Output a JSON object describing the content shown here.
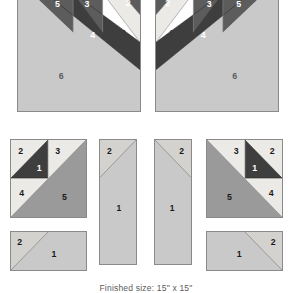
{
  "figure": {
    "caption": "Finished size: 15\" x 15\"",
    "palette": {
      "light": "#c9c9c9",
      "offwhite": "#eceae6",
      "medium": "#9a9a9a",
      "medium_dark": "#5c5c5c",
      "dark": "#3e3e3e",
      "outline": "#8a8a8a",
      "label_light": "#ffffff",
      "label_dark": "#1a1a1a",
      "caption_color": "#5b5b5b",
      "background": "#ffffff"
    }
  },
  "blocks": [
    {
      "id": "large-block-left",
      "name": "Large block A (left)",
      "pieces": [
        {
          "num": "1",
          "shade": "offwhite"
        },
        {
          "num": "2",
          "shade": "medium_dark"
        },
        {
          "num": "3",
          "shade": "medium_dark"
        },
        {
          "num": "4",
          "shade": "dark"
        },
        {
          "num": "5",
          "shade": "medium_dark"
        },
        {
          "num": "6",
          "shade": "light"
        }
      ]
    },
    {
      "id": "large-block-right",
      "name": "Large block B (right, mirrored)",
      "pieces": [
        {
          "num": "1",
          "shade": "offwhite"
        },
        {
          "num": "2",
          "shade": "medium_dark"
        },
        {
          "num": "3",
          "shade": "medium_dark"
        },
        {
          "num": "4",
          "shade": "dark"
        },
        {
          "num": "5",
          "shade": "medium_dark"
        },
        {
          "num": "6",
          "shade": "light"
        }
      ]
    },
    {
      "id": "unit-a",
      "name": "Unit A square (left)",
      "pieces": [
        {
          "num": "1",
          "shade": "dark"
        },
        {
          "num": "2",
          "shade": "offwhite"
        },
        {
          "num": "3",
          "shade": "offwhite"
        },
        {
          "num": "4",
          "shade": "offwhite"
        },
        {
          "num": "5",
          "shade": "medium"
        }
      ]
    },
    {
      "id": "unit-b",
      "name": "Unit B tall rectangle (left)",
      "pieces": [
        {
          "num": "1",
          "shade": "light"
        },
        {
          "num": "2",
          "shade": "light"
        }
      ]
    },
    {
      "id": "unit-c",
      "name": "Unit C tall rectangle (right)",
      "pieces": [
        {
          "num": "1",
          "shade": "light"
        },
        {
          "num": "2",
          "shade": "light"
        }
      ]
    },
    {
      "id": "unit-d",
      "name": "Unit D square (right, mirrored)",
      "pieces": [
        {
          "num": "1",
          "shade": "dark"
        },
        {
          "num": "2",
          "shade": "offwhite"
        },
        {
          "num": "3",
          "shade": "offwhite"
        },
        {
          "num": "4",
          "shade": "offwhite"
        },
        {
          "num": "5",
          "shade": "medium"
        }
      ]
    },
    {
      "id": "unit-e",
      "name": "Unit E wide rectangle (bottom left)",
      "pieces": [
        {
          "num": "1",
          "shade": "light"
        },
        {
          "num": "2",
          "shade": "light"
        }
      ]
    },
    {
      "id": "unit-f",
      "name": "Unit F wide rectangle (bottom right)",
      "pieces": [
        {
          "num": "1",
          "shade": "light"
        },
        {
          "num": "2",
          "shade": "light"
        }
      ]
    }
  ],
  "labels": {
    "large_left": {
      "p1": "1",
      "p2": "2",
      "p3": "3",
      "p4": "4",
      "p5": "5",
      "p6": "6"
    },
    "large_right": {
      "p1": "1",
      "p2": "2",
      "p3": "3",
      "p4": "4",
      "p5": "5",
      "p6": "6"
    },
    "unit_a": {
      "p1": "1",
      "p2": "2",
      "p3": "3",
      "p4": "4",
      "p5": "5"
    },
    "unit_b": {
      "p1": "1",
      "p2": "2"
    },
    "unit_c": {
      "p1": "1",
      "p2": "2"
    },
    "unit_d": {
      "p1": "1",
      "p2": "2",
      "p3": "3",
      "p4": "4",
      "p5": "5"
    },
    "unit_e": {
      "p1": "1",
      "p2": "2"
    },
    "unit_f": {
      "p1": "1",
      "p2": "2"
    }
  }
}
